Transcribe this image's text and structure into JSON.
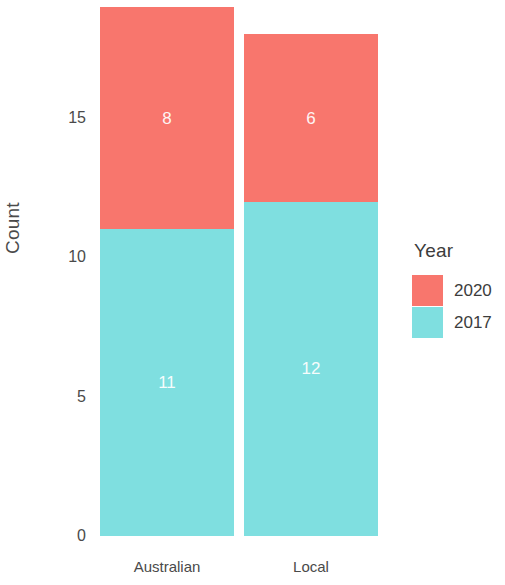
{
  "chart_data": {
    "type": "bar",
    "subtype": "stacked",
    "title": "",
    "xlabel": "",
    "ylabel": "Count",
    "categories": [
      "Australian",
      "Local"
    ],
    "series": [
      {
        "name": "2020",
        "color": "#f8766d",
        "values": [
          8,
          6
        ]
      },
      {
        "name": "2017",
        "color": "#7fdfe0",
        "values": [
          11,
          12
        ]
      }
    ],
    "stack_order_top_to_bottom": [
      "2020",
      "2017"
    ],
    "totals": [
      19,
      18
    ],
    "ylim": [
      0,
      19.5
    ],
    "y_ticks": [
      0,
      5,
      10,
      15
    ],
    "y_tick_labels": [
      "0",
      "5",
      "10",
      "15"
    ],
    "x_tick_labels": [
      "Australian",
      "Local"
    ],
    "grid": false,
    "legend": {
      "title": "Year",
      "position": "right",
      "entries": [
        {
          "label": "2020",
          "color": "#f8766d"
        },
        {
          "label": "2017",
          "color": "#7fdfe0"
        }
      ]
    },
    "data_labels": [
      {
        "category": "Australian",
        "series": "2020",
        "text": "8"
      },
      {
        "category": "Australian",
        "series": "2017",
        "text": "11"
      },
      {
        "category": "Local",
        "series": "2020",
        "text": "6"
      },
      {
        "category": "Local",
        "series": "2017",
        "text": "12"
      }
    ]
  },
  "axes": {
    "y_title": "Count",
    "y_ticks": [
      "15",
      "10",
      "5",
      "0"
    ]
  },
  "legend": {
    "title": "Year",
    "items": [
      {
        "label": "2020"
      },
      {
        "label": "2017"
      }
    ]
  },
  "bars": {
    "australian": {
      "x_label": "Australian",
      "top_label": "8",
      "bottom_label": "11"
    },
    "local": {
      "x_label": "Local",
      "top_label": "6",
      "bottom_label": "12"
    }
  },
  "colors": {
    "series_2020": "#f8766d",
    "series_2017": "#7fdfe0",
    "background": "#ffffff",
    "text": "#3c3c3c"
  }
}
